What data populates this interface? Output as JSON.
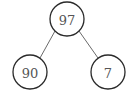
{
  "diagram": {
    "type": "binary-tree",
    "nodes": [
      {
        "id": "root",
        "label": "97",
        "cx": 67,
        "cy": 19,
        "r": 17
      },
      {
        "id": "left",
        "label": "90",
        "cx": 30,
        "cy": 72,
        "r": 17
      },
      {
        "id": "right",
        "label": "7",
        "cx": 108,
        "cy": 72,
        "r": 17
      }
    ],
    "edges": [
      {
        "from": "root",
        "to": "left"
      },
      {
        "from": "root",
        "to": "right"
      }
    ],
    "colors": {
      "stroke": "#2a2a2a",
      "edge": "#6a6a6a",
      "text": "#555555",
      "background": "#ffffff"
    }
  }
}
